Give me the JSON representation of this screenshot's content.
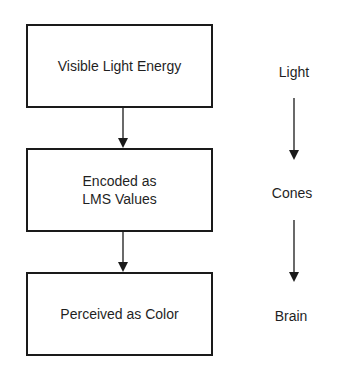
{
  "diagram": {
    "boxes": [
      {
        "id": "box-1",
        "label": "Visible Light Energy"
      },
      {
        "id": "box-2",
        "label": "Encoded as\nLMS Values"
      },
      {
        "id": "box-3",
        "label": "Perceived as Color"
      }
    ],
    "stages": [
      {
        "id": "stage-1",
        "label": "Light"
      },
      {
        "id": "stage-2",
        "label": "Cones"
      },
      {
        "id": "stage-3",
        "label": "Brain"
      }
    ],
    "colors": {
      "stroke": "#1a1a1a",
      "background": "#ffffff",
      "text": "#1f1f1f"
    }
  }
}
